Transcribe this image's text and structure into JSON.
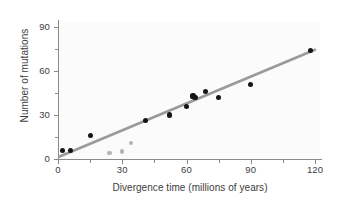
{
  "chart_data": {
    "type": "scatter",
    "title": "",
    "xlabel": "Divergence time (millions of years)",
    "ylabel": "Number of mutations",
    "xlim": [
      0,
      123
    ],
    "ylim": [
      0,
      95
    ],
    "grid": false,
    "legend": null,
    "xticks": [
      0,
      30,
      60,
      90,
      120
    ],
    "xtick_labels": [
      "0",
      "30",
      "60",
      "90",
      "120"
    ],
    "xminor_ticks": [
      15,
      45,
      75,
      105
    ],
    "yticks": [
      0,
      30,
      60,
      90
    ],
    "ytick_labels": [
      "0",
      "30",
      "60",
      "90"
    ],
    "yminor_ticks": [
      15,
      45,
      75
    ],
    "series": [
      {
        "name": "primary-samples",
        "color": "#151515",
        "marker": "filled-circle",
        "points": [
          {
            "x": 2,
            "y": 6
          },
          {
            "x": 6,
            "y": 6
          },
          {
            "x": 15,
            "y": 16
          },
          {
            "x": 41,
            "y": 26
          },
          {
            "x": 52,
            "y": 30
          },
          {
            "x": 60,
            "y": 36
          },
          {
            "x": 63,
            "y": 43
          },
          {
            "x": 64,
            "y": 42
          },
          {
            "x": 69,
            "y": 46
          },
          {
            "x": 75,
            "y": 42
          },
          {
            "x": 90,
            "y": 51
          },
          {
            "x": 118,
            "y": 74
          }
        ]
      },
      {
        "name": "outlier-samples",
        "color": "#b4b4b4",
        "marker": "filled-circle",
        "points": [
          {
            "x": 24,
            "y": 4
          },
          {
            "x": 30,
            "y": 5
          },
          {
            "x": 34,
            "y": 11
          }
        ]
      }
    ],
    "trendline": {
      "name": "regression-line",
      "color": "#9a9a9a",
      "x_start": 0.5,
      "y_start": 1.5,
      "x_end": 120,
      "y_end": 74.5
    }
  },
  "axes": {
    "x_title": "Divergence time (millions of years)",
    "y_title": "Number of mutations"
  }
}
